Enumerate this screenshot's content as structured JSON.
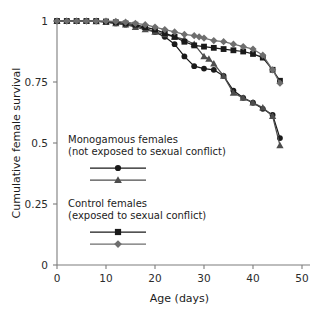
{
  "chart_data": {
    "type": "line",
    "title": "",
    "xlabel": "Age (days)",
    "ylabel": "Cumulative female survival",
    "xlim": [
      0,
      50
    ],
    "ylim": [
      0,
      1
    ],
    "xticks": [
      0,
      10,
      20,
      30,
      40,
      50
    ],
    "xtick_labels": [
      "0",
      "10",
      "20",
      "30",
      "40",
      "50"
    ],
    "yticks": [
      0,
      0.25,
      0.5,
      0.75,
      1
    ],
    "ytick_labels": [
      "0",
      "0.25",
      "0.5",
      "0.75",
      "1"
    ],
    "grid": false,
    "legend_position": "inside-left",
    "series": [
      {
        "name": "Monogamous females replicate 1",
        "group": "monogamous",
        "marker": "circle",
        "color": "#1a1a1a",
        "x": [
          0,
          2,
          4,
          6,
          8,
          10,
          12,
          14,
          16,
          18,
          20,
          22,
          24,
          26,
          28,
          30,
          32,
          34,
          36,
          38,
          40,
          42,
          44,
          45.5
        ],
        "y": [
          1.0,
          1.0,
          1.0,
          1.0,
          1.0,
          0.995,
          0.99,
          0.985,
          0.98,
          0.97,
          0.955,
          0.935,
          0.905,
          0.855,
          0.815,
          0.805,
          0.8,
          0.775,
          0.715,
          0.685,
          0.665,
          0.64,
          0.615,
          0.52
        ]
      },
      {
        "name": "Monogamous females replicate 2",
        "group": "monogamous",
        "marker": "triangle",
        "color": "#4d4d4d",
        "x": [
          0,
          2,
          4,
          6,
          8,
          10,
          12,
          14,
          16,
          18,
          20,
          22,
          24,
          26,
          28,
          30,
          31,
          32,
          34,
          36,
          38,
          40,
          42,
          44,
          45.5
        ],
        "y": [
          1.0,
          1.0,
          1.0,
          1.0,
          0.998,
          0.995,
          0.99,
          0.985,
          0.975,
          0.965,
          0.955,
          0.945,
          0.935,
          0.925,
          0.905,
          0.855,
          0.845,
          0.825,
          0.775,
          0.705,
          0.685,
          0.665,
          0.645,
          0.61,
          0.49
        ]
      },
      {
        "name": "Control females replicate 1",
        "group": "control",
        "marker": "square",
        "color": "#1a1a1a",
        "x": [
          0,
          2,
          4,
          6,
          8,
          10,
          12,
          14,
          16,
          18,
          20,
          22,
          24,
          26,
          28,
          30,
          32,
          34,
          36,
          38,
          40,
          42,
          44,
          45.5
        ],
        "y": [
          1.0,
          1.0,
          1.0,
          1.0,
          1.0,
          0.998,
          0.995,
          0.99,
          0.985,
          0.975,
          0.965,
          0.95,
          0.935,
          0.915,
          0.9,
          0.895,
          0.89,
          0.885,
          0.88,
          0.875,
          0.865,
          0.85,
          0.8,
          0.755
        ]
      },
      {
        "name": "Control females replicate 2",
        "group": "control",
        "marker": "diamond",
        "color": "#6e6e6e",
        "x": [
          0,
          2,
          4,
          6,
          8,
          10,
          12,
          14,
          16,
          18,
          20,
          22,
          24,
          26,
          28,
          29,
          30,
          32,
          34,
          36,
          38,
          40,
          42,
          44,
          45.5
        ],
        "y": [
          1.0,
          1.0,
          1.0,
          1.0,
          1.0,
          1.0,
          0.998,
          0.995,
          0.99,
          0.985,
          0.975,
          0.965,
          0.955,
          0.945,
          0.94,
          0.935,
          0.93,
          0.92,
          0.915,
          0.905,
          0.895,
          0.885,
          0.86,
          0.8,
          0.745
        ]
      }
    ]
  },
  "legend": {
    "group1": {
      "line1": "Monogamous females",
      "line2": "(not exposed to sexual conflict)",
      "entries": [
        {
          "marker": "circle",
          "color": "#1a1a1a"
        },
        {
          "marker": "triangle",
          "color": "#4d4d4d"
        }
      ]
    },
    "group2": {
      "line1": "Control females",
      "line2": "(exposed to sexual conflict)",
      "entries": [
        {
          "marker": "square",
          "color": "#1a1a1a"
        },
        {
          "marker": "diamond",
          "color": "#6e6e6e"
        }
      ]
    }
  },
  "colors": {
    "axis": "#7d7d7d",
    "text": "#1c1c1c",
    "background": "#ffffff"
  }
}
